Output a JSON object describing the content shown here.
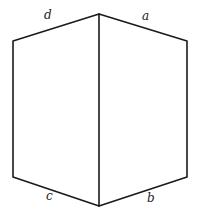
{
  "diagram": {
    "type": "hexagon-cube-outline",
    "stroke_color": "#1a1a1a",
    "label_color": "#222222",
    "vertices": {
      "top": [
        99,
        14
      ],
      "upper_right": [
        187,
        41
      ],
      "lower_right": [
        187,
        177
      ],
      "bottom": [
        99,
        206
      ],
      "lower_left": [
        13,
        177
      ],
      "upper_left": [
        13,
        41
      ]
    },
    "edge_labels": [
      {
        "text": "d",
        "edge": "upper_left-top",
        "x": 48,
        "y": 19
      },
      {
        "text": "a",
        "edge": "top-upper_right",
        "x": 145,
        "y": 20
      },
      {
        "text": "c",
        "edge": "lower_left-bottom",
        "x": 49,
        "y": 200
      },
      {
        "text": "b",
        "edge": "bottom-lower_right",
        "x": 150,
        "y": 202
      }
    ]
  }
}
